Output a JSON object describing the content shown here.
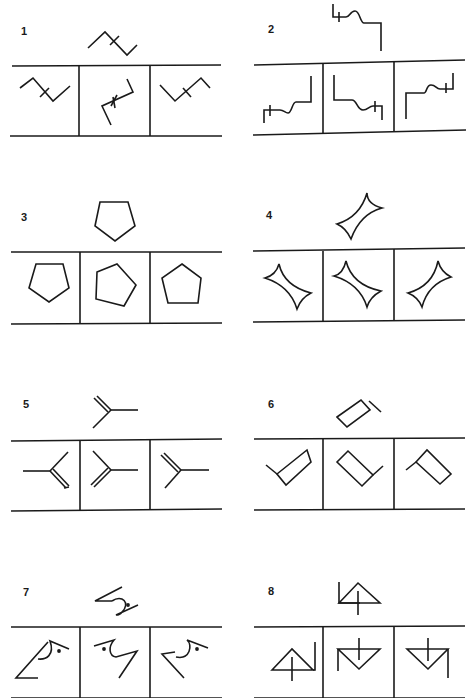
{
  "page": {
    "ink_color": "#1a1a1a",
    "background": "#ffffff"
  },
  "items": [
    {
      "number": "1",
      "target": "zigzag-with-crossbar",
      "options": [
        "zigzag-mirrored",
        "zigzag-rotated",
        "zigzag-rotated"
      ]
    },
    {
      "number": "2",
      "target": "stepped-line-with-bump-and-cross",
      "options": [
        "stepped-line-rotated",
        "stepped-line-mirrored",
        "stepped-line-rotated"
      ]
    },
    {
      "number": "3",
      "target": "pentagon",
      "options": [
        "pentagon-inverted",
        "pentagon-rotated",
        "pentagon"
      ]
    },
    {
      "number": "4",
      "target": "concave-diamond",
      "options": [
        "concave-diamond-rotated",
        "concave-diamond-rotated",
        "concave-diamond-rotated"
      ]
    },
    {
      "number": "5",
      "target": "y-fork-with-double-arm",
      "options": [
        "fork-mirrored",
        "fork-rotated",
        "fork-rotated"
      ]
    },
    {
      "number": "6",
      "target": "rectangle-with-tail",
      "options": [
        "rectangle-rotated",
        "rectangle-rotated",
        "rectangle-rotated"
      ]
    },
    {
      "number": "7",
      "target": "angle-hook-with-dot",
      "options": [
        "hook-rotated",
        "hook-mirrored",
        "hook-rotated"
      ]
    },
    {
      "number": "8",
      "target": "triangle-with-cross-and-stem",
      "options": [
        "triangle-rotated",
        "triangle-inverted",
        "triangle-inverted"
      ]
    }
  ]
}
